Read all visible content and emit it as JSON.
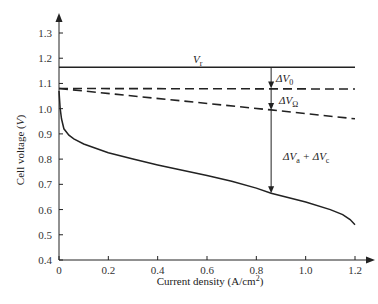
{
  "chart_data": {
    "type": "line",
    "title": "",
    "xlabel": "Current density (A/cm²)",
    "ylabel": "Cell voltage (V)",
    "xlim": [
      0,
      1.2
    ],
    "ylim": [
      0.4,
      1.3
    ],
    "x_ticks": [
      "0",
      "0.2",
      "0.4",
      "0.6",
      "0.8",
      "1.0",
      "1.2"
    ],
    "y_ticks": [
      "0.4",
      "0.5",
      "0.6",
      "0.7",
      "0.8",
      "0.9",
      "1.0",
      "1.1",
      "1.2",
      "1.3"
    ],
    "grid": false,
    "legend": "none",
    "series": [
      {
        "name": "Vr (reversible voltage)",
        "style": "solid",
        "x": [
          0,
          1.2
        ],
        "y": [
          1.164,
          1.164
        ]
      },
      {
        "name": "Open-circuit voltage (after ΔV0)",
        "style": "dashed",
        "x": [
          0,
          1.2
        ],
        "y": [
          1.08,
          1.078
        ]
      },
      {
        "name": "After ohmic loss ΔVΩ",
        "style": "dashed",
        "x": [
          0,
          0.86,
          1.2
        ],
        "y": [
          1.08,
          0.995,
          0.96
        ]
      },
      {
        "name": "Cell voltage (polarization curve)",
        "style": "solid",
        "x": [
          0,
          0.005,
          0.01,
          0.02,
          0.04,
          0.06,
          0.1,
          0.2,
          0.3,
          0.4,
          0.5,
          0.6,
          0.7,
          0.8,
          0.86,
          0.9,
          1.0,
          1.1,
          1.15,
          1.18,
          1.2
        ],
        "y": [
          1.07,
          1.0,
          0.96,
          0.92,
          0.895,
          0.88,
          0.86,
          0.825,
          0.8,
          0.777,
          0.756,
          0.735,
          0.712,
          0.685,
          0.665,
          0.655,
          0.63,
          0.6,
          0.58,
          0.56,
          0.54
        ]
      }
    ],
    "annotations": [
      {
        "text": "Vr",
        "x": 0.62,
        "y": 1.175
      },
      {
        "text": "ΔV0",
        "x": 0.9,
        "y": 1.12,
        "arrow_from": 1.164,
        "arrow_to": 1.08,
        "arrow_x": 0.86
      },
      {
        "text": "ΔVΩ",
        "x": 0.9,
        "y": 1.04,
        "arrow_from": 1.08,
        "arrow_to": 0.995,
        "arrow_x": 0.86
      },
      {
        "text": "ΔVa + ΔVc",
        "x": 0.9,
        "y": 0.82,
        "arrow_from": 0.995,
        "arrow_to": 0.665,
        "arrow_x": 0.86
      }
    ]
  },
  "labels": {
    "xlabel_main": "Current density (A/cm",
    "xlabel_sup": "2",
    "xlabel_end": ")",
    "ylabel_main": "Cell voltage (",
    "ylabel_var": "V",
    "ylabel_end": ")",
    "vr_main": "V",
    "vr_sub": "r",
    "dv0_main": "ΔV",
    "dv0_sub": "0",
    "dvo_main": "ΔV",
    "dvo_sub": "Ω",
    "dvac_a": "ΔV",
    "dvac_a_sub": "a",
    "dvac_plus": " + ΔV",
    "dvac_c_sub": "c"
  }
}
